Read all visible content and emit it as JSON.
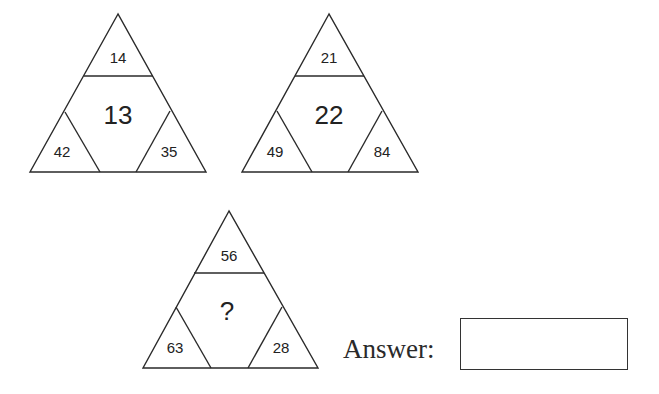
{
  "puzzle": {
    "triangles": [
      {
        "top": "14",
        "center": "13",
        "left": "42",
        "right": "35"
      },
      {
        "top": "21",
        "center": "22",
        "left": "49",
        "right": "84"
      },
      {
        "top": "56",
        "center": "?",
        "left": "63",
        "right": "28"
      }
    ]
  },
  "answer": {
    "label": "Answer:",
    "value": ""
  }
}
